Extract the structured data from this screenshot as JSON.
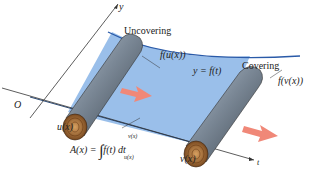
{
  "diagram": {
    "labels": {
      "y_axis": "y",
      "t_axis": "t",
      "origin": "O",
      "uncovering": "Uncovering",
      "covering": "Covering",
      "f_u": "f(u(x))",
      "f_v": "f(v(x))",
      "curve": "y = f(t)",
      "u": "u(x)",
      "v": "v(x)"
    },
    "formula": {
      "lhs": "A(x) = ",
      "upper": "v(x)",
      "lower": "u(x)",
      "integrand": "f(t) dt"
    },
    "colors": {
      "region": "#8fb8e8",
      "curve": "#2a5aa8",
      "roll": "#7a8a9a",
      "roll_end": "#a86a30",
      "arrow": "#f08878",
      "axis": "#333333"
    }
  }
}
